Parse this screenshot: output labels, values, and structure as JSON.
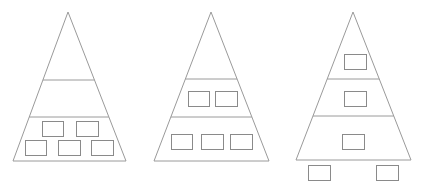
{
  "diagram": {
    "stroke_color": "#9a9a9a",
    "box_color": "#8a8a8a",
    "background": "#ffffff",
    "pyramids": [
      {
        "name": "pyramid-1",
        "apex": [
          68,
          12
        ],
        "base_left": [
          13,
          161
        ],
        "base_right": [
          126,
          161
        ],
        "dividers": [
          80,
          117
        ],
        "boxes": [
          [
            42,
            121,
            21,
            15
          ],
          [
            76,
            121,
            22,
            15
          ],
          [
            25,
            140,
            21,
            15
          ],
          [
            58,
            140,
            22,
            15
          ],
          [
            91,
            140,
            22,
            15
          ]
        ]
      },
      {
        "name": "pyramid-2",
        "apex": [
          211,
          12
        ],
        "base_left": [
          154,
          161
        ],
        "base_right": [
          269,
          161
        ],
        "dividers": [
          79,
          117
        ],
        "boxes": [
          [
            188,
            91,
            21,
            15
          ],
          [
            215,
            91,
            22,
            15
          ],
          [
            171,
            134,
            21,
            15
          ],
          [
            201,
            134,
            22,
            15
          ],
          [
            230,
            134,
            22,
            15
          ]
        ]
      },
      {
        "name": "pyramid-3",
        "apex": [
          353,
          12
        ],
        "base_left": [
          296,
          160
        ],
        "base_right": [
          411,
          160
        ],
        "dividers": [
          79,
          116
        ],
        "boxes": [
          [
            344,
            54,
            22,
            15
          ],
          [
            344,
            91,
            22,
            15
          ],
          [
            342,
            134,
            22,
            15
          ],
          [
            308,
            165,
            22,
            15
          ],
          [
            376,
            165,
            22,
            15
          ]
        ]
      }
    ]
  }
}
